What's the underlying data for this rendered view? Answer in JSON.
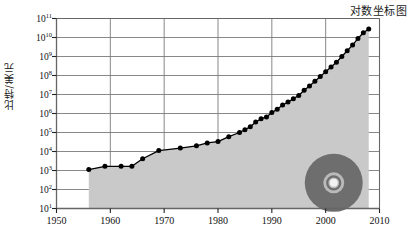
{
  "chart_data": {
    "type": "line",
    "title": "对数坐标图",
    "xlabel": "",
    "ylabel": "比特/美元",
    "xlim": [
      1950,
      2010
    ],
    "ylim_log10": [
      1,
      11
    ],
    "yscale": "log",
    "grid": true,
    "legend": null,
    "xticks": [
      "1950",
      "1960",
      "1970",
      "1980",
      "1990",
      "2000",
      "2010"
    ],
    "xtick_values": [
      1950,
      1960,
      1970,
      1980,
      1990,
      2000,
      2010
    ],
    "yticks": [
      "10^1",
      "10^2",
      "10^3",
      "10^4",
      "10^5",
      "10^6",
      "10^7",
      "10^8",
      "10^9",
      "10^10",
      "10^11"
    ],
    "ytick_exponents": [
      1,
      2,
      3,
      4,
      5,
      6,
      7,
      8,
      9,
      10,
      11
    ],
    "series": [
      {
        "name": "比特/美元",
        "fill": true,
        "fill_color": "#c9c9c9",
        "line_color": "#000000",
        "marker": "circle",
        "x": [
          1956,
          1959,
          1962,
          1964,
          1966,
          1969,
          1973,
          1976,
          1978,
          1980,
          1982,
          1984,
          1985,
          1986,
          1987,
          1988,
          1989,
          1990,
          1991,
          1992,
          1993,
          1994,
          1995,
          1996,
          1997,
          1998,
          1999,
          2000,
          2001,
          2002,
          2003,
          2004,
          2005,
          2006,
          2007,
          2008
        ],
        "y_log10": [
          3.05,
          3.22,
          3.22,
          3.22,
          3.62,
          4.05,
          4.18,
          4.3,
          4.45,
          4.52,
          4.78,
          5.0,
          5.15,
          5.3,
          5.55,
          5.72,
          5.82,
          6.05,
          6.22,
          6.45,
          6.6,
          6.78,
          6.95,
          7.22,
          7.45,
          7.7,
          7.95,
          8.2,
          8.45,
          8.7,
          9.0,
          9.3,
          9.6,
          9.95,
          10.25,
          10.45
        ]
      }
    ],
    "annotations": [
      {
        "name": "cd-disc-watermark",
        "type": "disc-icon",
        "x_year": 2001.5,
        "y_log10": 2.35,
        "outer_color": "#6e6e6e",
        "ring_color": "#b9b9b9",
        "hole_color": "#f2f2f2"
      }
    ]
  },
  "axes": {
    "frame_color": "#666666",
    "grid_color": "#7a7a7a",
    "background": "#ffffff"
  }
}
